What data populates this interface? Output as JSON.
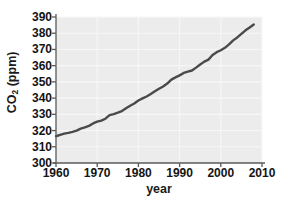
{
  "chart_data": {
    "type": "line",
    "title": "",
    "xlabel": "year",
    "ylabel": "CO2 (ppm)",
    "ylabel_base": "CO",
    "ylabel_sub": "2",
    "ylabel_unit": " (ppm)",
    "xlim": [
      1960,
      2010
    ],
    "ylim": [
      300,
      390
    ],
    "xticks": [
      1960,
      1970,
      1980,
      1990,
      2000,
      2010
    ],
    "xtick_labels": [
      "1960",
      "1970",
      "1980",
      "1990",
      "2000",
      "2010"
    ],
    "yticks": [
      300,
      310,
      320,
      330,
      340,
      350,
      360,
      370,
      380,
      390
    ],
    "ytick_labels": [
      "300",
      "310",
      "320",
      "330",
      "340",
      "350",
      "360",
      "370",
      "380",
      "390"
    ],
    "grid": true,
    "grid_x": true,
    "grid_y": true,
    "legend": "none",
    "plot_background": "#ececec",
    "grid_color": "#f7f7f7",
    "axis_color": "#5a5a5a",
    "line_color": "#4a4a4a",
    "line_width": 2.4,
    "series": [
      {
        "name": "CO2 concentration",
        "x": [
          1959,
          1960,
          1961,
          1962,
          1963,
          1964,
          1965,
          1966,
          1967,
          1968,
          1969,
          1970,
          1971,
          1972,
          1973,
          1974,
          1975,
          1976,
          1977,
          1978,
          1979,
          1980,
          1981,
          1982,
          1983,
          1984,
          1985,
          1986,
          1987,
          1988,
          1989,
          1990,
          1991,
          1992,
          1993,
          1994,
          1995,
          1996,
          1997,
          1998,
          1999,
          2000,
          2001,
          2002,
          2003,
          2004,
          2005,
          2006,
          2007,
          2008
        ],
        "values": [
          315.9,
          316.5,
          317.3,
          318.1,
          318.6,
          319.2,
          320.0,
          321.2,
          322.0,
          322.9,
          324.4,
          325.5,
          326.1,
          327.3,
          329.5,
          330.1,
          331.0,
          332.0,
          333.7,
          335.3,
          336.7,
          338.5,
          339.8,
          341.0,
          342.6,
          344.2,
          345.8,
          347.2,
          349.0,
          351.4,
          352.8,
          354.0,
          355.5,
          356.3,
          357.0,
          358.8,
          360.7,
          362.5,
          363.7,
          366.6,
          368.3,
          369.5,
          371.0,
          373.1,
          375.6,
          377.4,
          379.6,
          381.8,
          383.5,
          385.4
        ]
      }
    ]
  }
}
